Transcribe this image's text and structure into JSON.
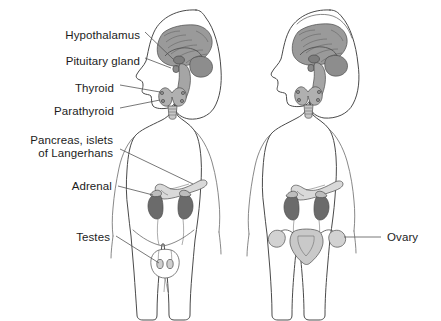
{
  "diagram": {
    "background_color": "#ffffff",
    "outline_color": "#4a4a4a",
    "leader_line_color": "#555555",
    "text_color": "#1c1c1c",
    "organ_colors": {
      "brain": "#9a9a9a",
      "brain_detail": "#6f6f6f",
      "pituitary": "#8a8a8a",
      "thyroid": "#b0b0b0",
      "parathyroid": "#8f8f8f",
      "pancreas": "#d9d9d9",
      "kidney": "#6b6b6b",
      "adrenal": "#bdbdbd",
      "uterus": "#c9c9c9",
      "ovary": "#d2d2d2",
      "testis": "#cfcfcf"
    },
    "figures": [
      {
        "name": "male-figure",
        "sex_label": "male",
        "position": "left"
      },
      {
        "name": "female-figure",
        "sex_label": "female",
        "position": "right"
      }
    ],
    "labels": [
      {
        "id": "hypothalamus",
        "text": "Hypothalamus",
        "side": "right",
        "x": 140,
        "y": 35,
        "align": "right"
      },
      {
        "id": "pituitary-gland",
        "text": "Pituitary gland",
        "side": "right",
        "x": 140,
        "y": 61,
        "align": "right"
      },
      {
        "id": "thyroid",
        "text": "Thyroid",
        "side": "right",
        "x": 114,
        "y": 88,
        "align": "right"
      },
      {
        "id": "parathyroid",
        "text": "Parathyroid",
        "side": "right",
        "x": 114,
        "y": 111,
        "align": "right"
      },
      {
        "id": "pancreas-islets",
        "text": "Pancreas, islets",
        "text_line2": "of Langerhans",
        "side": "right",
        "x": 113,
        "y": 139,
        "align": "right"
      },
      {
        "id": "adrenal",
        "text": "Adrenal",
        "side": "right",
        "x": 112,
        "y": 182,
        "align": "right"
      },
      {
        "id": "testes",
        "text": "Testes",
        "side": "right",
        "x": 110,
        "y": 233,
        "align": "right"
      },
      {
        "id": "ovary",
        "text": "Ovary",
        "side": "left",
        "x": 387,
        "y": 229,
        "align": "left"
      }
    ]
  }
}
